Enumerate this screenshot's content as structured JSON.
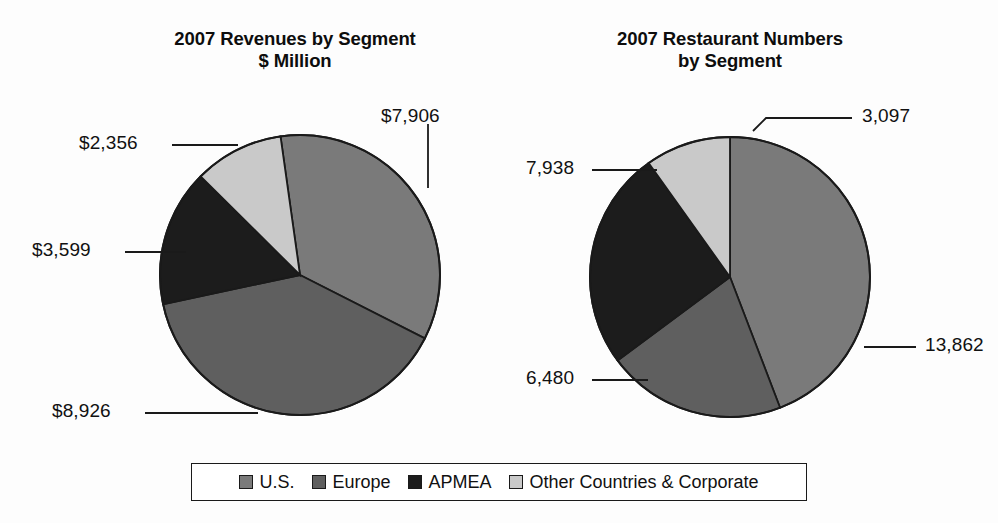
{
  "figure": {
    "background": "#fdfdfd"
  },
  "charts": [
    {
      "id": "revenues",
      "title": "2007 Revenues by Segment\n$ Million"
    },
    {
      "id": "restaurants",
      "title": "2007 Restaurant Numbers\nby Segment"
    }
  ],
  "legend": {
    "items": [
      {
        "label": "U.S.",
        "color": "#7a7a7a"
      },
      {
        "label": "Europe",
        "color": "#5f5f5f"
      },
      {
        "label": "APMEA",
        "color": "#1c1c1c"
      },
      {
        "label": "Other Countries & Corporate",
        "color": "#c9c9c9"
      }
    ]
  },
  "callouts": {
    "left": {
      "us": "$7,906",
      "europe": "$8,926",
      "apmea": "$3,599",
      "other": "$2,356"
    },
    "right": {
      "us": "13,862",
      "europe": "6,480",
      "apmea": "7,938",
      "other": "3,097"
    }
  },
  "chart_data": [
    {
      "type": "pie",
      "id": "revenues",
      "title": "2007 Revenues by Segment $ Million",
      "unit": "$ Million",
      "categories": [
        "U.S.",
        "Europe",
        "APMEA",
        "Other Countries & Corporate"
      ],
      "values": [
        7906,
        8926,
        3599,
        2356
      ],
      "labels": [
        "$7,906",
        "$8,926",
        "$3,599",
        "$2,356"
      ],
      "colors": [
        "#7a7a7a",
        "#5f5f5f",
        "#1c1c1c",
        "#c9c9c9"
      ],
      "total": 22787,
      "percentages": [
        34.7,
        39.2,
        15.8,
        10.3
      ],
      "start_angle_deg": -8,
      "direction": "clockwise",
      "legend_position": "bottom",
      "grid": false
    },
    {
      "type": "pie",
      "id": "restaurants",
      "title": "2007 Restaurant Numbers by Segment",
      "unit": "restaurants",
      "categories": [
        "U.S.",
        "Europe",
        "APMEA",
        "Other Countries & Corporate"
      ],
      "values": [
        13862,
        6480,
        7938,
        3097
      ],
      "labels": [
        "13,862",
        "6,480",
        "7,938",
        "3,097"
      ],
      "colors": [
        "#7a7a7a",
        "#5f5f5f",
        "#1c1c1c",
        "#c9c9c9"
      ],
      "total": 31377,
      "percentages": [
        44.2,
        20.7,
        25.3,
        9.9
      ],
      "start_angle_deg": 0,
      "direction": "clockwise",
      "legend_position": "bottom",
      "grid": false
    }
  ]
}
